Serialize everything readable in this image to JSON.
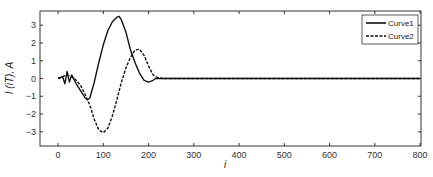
{
  "chart_data": {
    "type": "line",
    "title": "",
    "xlabel": "i",
    "ylabel": "I (iT), A",
    "xlim": [
      -40,
      802
    ],
    "ylim": [
      -3.8,
      3.8
    ],
    "xticks": [
      0,
      100,
      200,
      300,
      400,
      500,
      600,
      700,
      800
    ],
    "yticks": [
      -3,
      -2,
      -1,
      0,
      1,
      2,
      3
    ],
    "grid": false,
    "legend_position": "upper right",
    "series": [
      {
        "name": "Curve1",
        "style": "solid",
        "x": [
          0,
          10,
          15,
          20,
          25,
          30,
          40,
          50,
          60,
          65,
          70,
          80,
          90,
          100,
          110,
          120,
          130,
          135,
          140,
          150,
          160,
          170,
          180,
          190,
          200,
          210,
          215,
          220,
          230,
          300,
          400,
          500,
          600,
          700,
          800
        ],
        "y": [
          0,
          0.1,
          -0.3,
          0.4,
          -0.2,
          0.2,
          -0.3,
          -0.7,
          -1.1,
          -1.2,
          -1.1,
          -0.2,
          0.9,
          1.9,
          2.7,
          3.2,
          3.45,
          3.5,
          3.3,
          2.6,
          1.6,
          0.9,
          0.3,
          -0.1,
          -0.2,
          -0.1,
          0.0,
          0.0,
          0.0,
          0.0,
          0.0,
          0.0,
          0.0,
          0.0,
          0.0
        ]
      },
      {
        "name": "Curve2",
        "style": "dashed",
        "x": [
          0,
          10,
          20,
          30,
          40,
          50,
          60,
          70,
          80,
          90,
          100,
          110,
          120,
          130,
          140,
          150,
          160,
          170,
          180,
          190,
          200,
          210,
          220,
          230,
          300,
          400,
          500,
          600,
          700,
          800
        ],
        "y": [
          0,
          0.1,
          0.2,
          0.1,
          -0.1,
          -0.4,
          -0.9,
          -1.5,
          -2.3,
          -2.9,
          -3.05,
          -2.8,
          -2.1,
          -1.2,
          -0.2,
          0.6,
          1.2,
          1.6,
          1.65,
          1.3,
          0.7,
          0.2,
          0.05,
          0.0,
          0.0,
          0.0,
          0.0,
          0.0,
          0.0,
          0.0
        ]
      }
    ]
  },
  "legend": {
    "items": [
      {
        "label": "Curve1"
      },
      {
        "label": "Curve2"
      }
    ]
  },
  "axes": {
    "xlabel": "i",
    "ylabel": "I (iT), A"
  }
}
